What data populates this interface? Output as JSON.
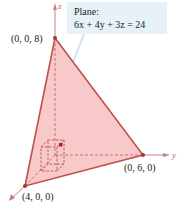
{
  "callout": {
    "title": "Plane:",
    "equation": "6x + 4y + 3z = 24"
  },
  "axes": {
    "x": "x",
    "y": "y",
    "z": "z"
  },
  "points": {
    "z_intercept": "(0, 0, 8)",
    "y_intercept": "(0, 6, 0)",
    "x_intercept": "(4, 0, 0)"
  },
  "colors": {
    "plane_fill": "#f4b8b8",
    "plane_edge": "#c0504d",
    "axis": "#c88080",
    "callout_bg": "#e6f1f8"
  }
}
